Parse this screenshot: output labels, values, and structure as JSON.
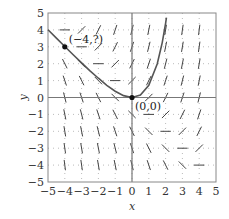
{
  "chart_data": {
    "type": "line",
    "subtype": "slope-field",
    "title": "",
    "xlabel": "x",
    "ylabel": "y",
    "xlim": [
      -5,
      5
    ],
    "ylim": [
      -5,
      5
    ],
    "xticks": [
      -5,
      -4,
      -3,
      -2,
      -1,
      0,
      1,
      2,
      3,
      4,
      5
    ],
    "yticks": [
      -5,
      -4,
      -3,
      -2,
      -1,
      0,
      1,
      2,
      3,
      4,
      5
    ],
    "xtick_labels": [
      "−5",
      "−4",
      "−3",
      "−2",
      "−1",
      "0",
      "1",
      "2",
      "3",
      "4",
      "5"
    ],
    "ytick_labels": [
      "−5",
      "−4",
      "−3",
      "−2",
      "−1",
      "0",
      "1",
      "2",
      "3",
      "4",
      "5"
    ],
    "grid": "dotted",
    "differential_equation": "dy/dx = x + y",
    "slope_field": {
      "x_range": [
        -4,
        4
      ],
      "y_range": [
        -4,
        4
      ],
      "step": 1,
      "slope_rule": "x + y"
    },
    "series": [
      {
        "name": "solution curve through (0,0)",
        "x": [
          -5,
          -4.5,
          -4,
          -3.5,
          -3,
          -2.5,
          -2,
          -1.5,
          -1,
          -0.5,
          0,
          0.5,
          1,
          1.5,
          1.8,
          2.0,
          2.05
        ],
        "y": [
          4.01,
          3.51,
          3.02,
          2.53,
          2.05,
          1.58,
          1.14,
          0.72,
          0.37,
          0.11,
          0,
          0.15,
          0.72,
          1.98,
          3.25,
          4.39,
          4.72
        ]
      }
    ],
    "points": [
      {
        "x": 0,
        "y": 0,
        "label": "(0,0)"
      },
      {
        "x": -4,
        "y": 3,
        "label": "(−4,?)"
      }
    ],
    "colors": {
      "curve": "#555555",
      "segments": "#444444",
      "axes": "#777777",
      "grid": "#aaaaaa",
      "points": "#111111"
    }
  }
}
